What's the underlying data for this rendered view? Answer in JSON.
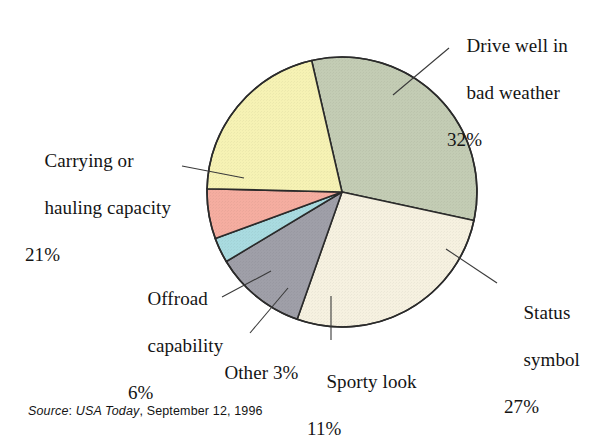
{
  "figure": {
    "source_prefix": "Source",
    "source_publication": "USA Today",
    "source_date": ", September 12, 1996",
    "source_separator": ": "
  },
  "chart_data": {
    "type": "pie",
    "title": "",
    "subtitle": "",
    "xlabel": "",
    "ylabel": "",
    "legend_position": "callout-labels",
    "grid": false,
    "units": "percent",
    "total": 100,
    "categories": [
      "Drive well in bad weather",
      "Status symbol",
      "Sporty look",
      "Other",
      "Offroad capability",
      "Carrying or hauling capacity"
    ],
    "values": [
      32,
      27,
      11,
      3,
      6,
      21
    ],
    "colors": [
      "#c3ccb4",
      "#f6f1e0",
      "#9f9fa8",
      "#a9dbe0",
      "#f5ada0",
      "#f6f2b4"
    ],
    "slices": [
      {
        "label": "Drive well in bad weather",
        "label_line1": "Drive well in",
        "label_line2": "bad weather",
        "value": 32,
        "percent_text": "32%",
        "color": "#c3ccb4",
        "start_angle": -13,
        "end_angle": 102.2
      },
      {
        "label": "Status symbol",
        "label_line1": "Status",
        "label_line2": "symbol",
        "value": 27,
        "percent_text": "27%",
        "color": "#f6f1e0",
        "start_angle": 102.2,
        "end_angle": 199.4
      },
      {
        "label": "Sporty look",
        "label_line1": "Sporty look",
        "label_line2": "",
        "value": 11,
        "percent_text": "11%",
        "color": "#9f9fa8",
        "start_angle": 199.4,
        "end_angle": 239.0
      },
      {
        "label": "Other",
        "label_line1": "Other 3%",
        "label_line2": "",
        "value": 3,
        "percent_text": "3%",
        "color": "#a9dbe0",
        "start_angle": 239.0,
        "end_angle": 249.8
      },
      {
        "label": "Offroad capability",
        "label_line1": "Offroad",
        "label_line2": "capability",
        "value": 6,
        "percent_text": "6%",
        "color": "#f5ada0",
        "start_angle": 249.8,
        "end_angle": 271.4
      },
      {
        "label": "Carrying or hauling capacity",
        "label_line1": "Carrying or",
        "label_line2": "hauling capacity",
        "value": 21,
        "percent_text": "21%",
        "color": "#f6f2b4",
        "start_angle": 271.4,
        "end_angle": 347.0
      }
    ],
    "geometry": {
      "center_x": 342,
      "center_y": 192,
      "radius": 135,
      "stroke": "#2b2b2b",
      "stroke_width": 1.6
    }
  }
}
